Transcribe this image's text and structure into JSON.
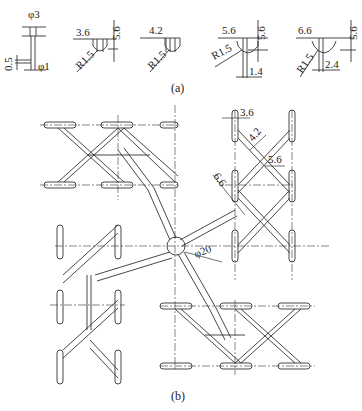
{
  "figure_a": {
    "caption": "(a)",
    "profiles": [
      {
        "id": "p1",
        "labels": {
          "top": "φ3",
          "left": "0.5",
          "bottom": "φ1"
        }
      },
      {
        "id": "p2",
        "labels": {
          "width": "3.6",
          "depth": "5.6",
          "radius": "R1.5"
        }
      },
      {
        "id": "p3",
        "labels": {
          "width": "4.2",
          "depth": "5.6",
          "radius": "R1.5"
        }
      },
      {
        "id": "p4",
        "labels": {
          "width": "5.6",
          "depth": "5.6",
          "radius": "R1.5",
          "bottom": "1.4"
        }
      },
      {
        "id": "p5",
        "labels": {
          "width": "6.6",
          "depth": "5.6",
          "radius": "R1.5",
          "bottom": "2.4"
        }
      }
    ]
  },
  "figure_b": {
    "caption": "(b)",
    "labels": {
      "w36": "3.6",
      "w42": "4.2",
      "w56": "5.6",
      "w66": "6.6",
      "center_dia": "φ20"
    }
  },
  "colors": {
    "line": "#333333",
    "background": "#ffffff"
  }
}
